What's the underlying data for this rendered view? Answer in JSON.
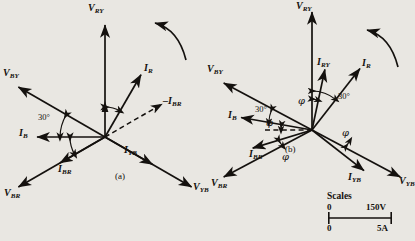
{
  "figure": {
    "background_color": "#e9e7e2",
    "ink_color": "#14110e",
    "panels": [
      {
        "id": "a",
        "caption": "(a)",
        "origin": [
          105,
          137
        ],
        "rotation_arrow": "counterclockwise",
        "vectors": [
          {
            "name": "V_RY",
            "label": "V",
            "sub": "RY",
            "angle_deg": 90,
            "length": 112,
            "style": "solid",
            "kind": "voltage"
          },
          {
            "name": "V_BY",
            "label": "V",
            "sub": "BY",
            "angle_deg": 150,
            "length": 100,
            "style": "solid",
            "kind": "voltage"
          },
          {
            "name": "V_YB",
            "label": "V",
            "sub": "YB",
            "angle_deg": -30,
            "length": 100,
            "style": "solid",
            "kind": "voltage"
          },
          {
            "name": "V_BR",
            "label": "V",
            "sub": "BR",
            "angle_deg": -150,
            "length": 100,
            "style": "solid",
            "kind": "voltage"
          },
          {
            "name": "I_R",
            "label": "I",
            "sub": "R",
            "angle_deg": 60,
            "length": 72,
            "style": "solid",
            "kind": "current"
          },
          {
            "name": "I_B",
            "label": "I",
            "sub": "B",
            "angle_deg": 180,
            "length": 68,
            "style": "solid",
            "kind": "current"
          },
          {
            "name": "I_BR",
            "label": "I",
            "sub": "BR",
            "angle_deg": -150,
            "length": 52,
            "style": "solid",
            "kind": "current"
          },
          {
            "name": "I_YB",
            "label": "I",
            "sub": "YB",
            "angle_deg": -30,
            "length": 55,
            "style": "solid",
            "kind": "current"
          },
          {
            "name": "-I_BR",
            "label": "–I",
            "sub": "BR",
            "angle_deg": 30,
            "length": 66,
            "style": "dashed",
            "kind": "current"
          }
        ],
        "angle_labels": [
          {
            "text": "30°",
            "between": [
              "V_BY",
              "I_B"
            ]
          }
        ]
      },
      {
        "id": "b",
        "caption": "(b)",
        "origin": [
          312,
          130
        ],
        "rotation_arrow": "counterclockwise",
        "vectors": [
          {
            "name": "V_RY",
            "label": "V",
            "sub": "RY",
            "angle_deg": 90,
            "length": 118,
            "style": "solid",
            "kind": "voltage"
          },
          {
            "name": "V_BY",
            "label": "V",
            "sub": "BY",
            "angle_deg": 152,
            "length": 100,
            "style": "solid",
            "kind": "voltage"
          },
          {
            "name": "V_YB",
            "label": "V",
            "sub": "YB",
            "angle_deg": -28,
            "length": 100,
            "style": "solid",
            "kind": "voltage"
          },
          {
            "name": "V_BR",
            "label": "V",
            "sub": "BR",
            "angle_deg": -152,
            "length": 100,
            "style": "solid",
            "kind": "voltage"
          },
          {
            "name": "I_R",
            "label": "I",
            "sub": "R",
            "angle_deg": 52,
            "length": 78,
            "style": "solid",
            "kind": "current"
          },
          {
            "name": "I_RY",
            "label": "I",
            "sub": "RY",
            "angle_deg": 78,
            "length": 62,
            "style": "solid",
            "kind": "current"
          },
          {
            "name": "I_B",
            "label": "I",
            "sub": "B",
            "angle_deg": 170,
            "length": 72,
            "style": "solid",
            "kind": "current"
          },
          {
            "name": "I_BR",
            "label": "I",
            "sub": "BR",
            "angle_deg": -163,
            "length": 62,
            "style": "solid",
            "kind": "current"
          },
          {
            "name": "I_YB",
            "label": "I",
            "sub": "YB",
            "angle_deg": -38,
            "length": 66,
            "style": "solid",
            "kind": "current"
          },
          {
            "name": "ref_dashed",
            "label": "",
            "sub": "",
            "angle_deg": 180,
            "length": 48,
            "style": "dashed",
            "kind": "reference"
          }
        ],
        "angle_labels": [
          {
            "text": "30°",
            "between": [
              "V_RY",
              "I_R"
            ]
          },
          {
            "text": "30°",
            "between": [
              "V_BY",
              "I_B"
            ]
          },
          {
            "text": "φ",
            "between": [
              "V_RY",
              "I_RY"
            ]
          },
          {
            "text": "φ",
            "between": [
              "I_B",
              "ref_dashed"
            ]
          },
          {
            "text": "φ",
            "between": [
              "I_R",
              "V_YB"
            ]
          },
          {
            "text": "φ",
            "between": [
              "I_BR",
              "V_BR"
            ]
          }
        ]
      }
    ],
    "scales": {
      "title": "Scales",
      "voltage_min": "0",
      "voltage_max": "150V",
      "current_min": "0",
      "current_max": "5A"
    }
  }
}
